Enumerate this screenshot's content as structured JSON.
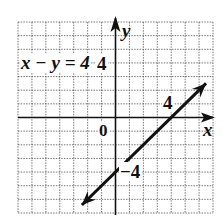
{
  "chart_data": {
    "type": "line",
    "title": "",
    "xlabel": "x",
    "ylabel": "y",
    "xlim": [
      -7,
      7
    ],
    "ylim": [
      -7,
      7
    ],
    "grid": true,
    "grid_step": 1,
    "equation_label": "x − y = 4",
    "series": [
      {
        "name": "x − y = 4",
        "x": [
          -4.5,
          0,
          4,
          6.5
        ],
        "y": [
          -8.5,
          -4,
          0,
          2.5
        ],
        "arrows": "both"
      }
    ],
    "tick_labels": [
      {
        "axis": "x",
        "value": 4,
        "text": "4"
      },
      {
        "axis": "y",
        "value": -4,
        "text": "−4"
      },
      {
        "axis": "origin",
        "value": 0,
        "text": "0"
      }
    ],
    "annotations": [
      {
        "text": "4",
        "note": "y-intercept marker near (0,4) on y-axis"
      },
      {
        "text": "4",
        "note": "label near arrow head at x=4"
      }
    ]
  },
  "labels": {
    "equation": "x − y = 4",
    "y_axis": "y",
    "x_axis": "x",
    "origin": "0",
    "y_tick_pos": "4",
    "x_tick_pos": "4",
    "y_tick_neg": "−4"
  },
  "colors": {
    "grid": "#555555",
    "axis": "#111111",
    "line": "#111111"
  }
}
